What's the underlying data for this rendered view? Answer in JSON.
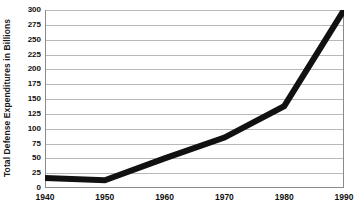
{
  "chart_data": {
    "type": "line",
    "title": "",
    "xlabel": "",
    "ylabel": "Total Defense Expenditures in Billions",
    "x": [
      1940,
      1950,
      1960,
      1970,
      1980,
      1990
    ],
    "values": [
      17,
      13,
      50,
      85,
      138,
      300
    ],
    "series": [
      {
        "name": "Total Defense Expenditures",
        "values": [
          17,
          13,
          50,
          85,
          138,
          300
        ]
      }
    ],
    "xtick_labels": [
      "1940",
      "1950",
      "1960",
      "1970",
      "1980",
      "1990"
    ],
    "ytick_labels": [
      "0",
      "25",
      "50",
      "75",
      "100",
      "125",
      "150",
      "175",
      "200",
      "225",
      "250",
      "275",
      "300"
    ],
    "ytick_values": [
      0,
      25,
      50,
      75,
      100,
      125,
      150,
      175,
      200,
      225,
      250,
      275,
      300
    ],
    "xlim": [
      1940,
      1990
    ],
    "ylim": [
      0,
      300
    ],
    "grid": "horizontal",
    "legend": "none",
    "line_color": "#111111",
    "grid_color": "#b8b8b8",
    "axis_color": "#8a8a8a",
    "background_color": "#ffffff",
    "line_width_px": 6
  }
}
